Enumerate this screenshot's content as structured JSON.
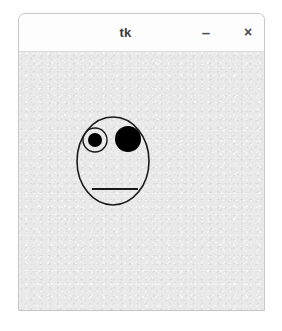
{
  "window": {
    "title": "tk",
    "background_color": "#e9e9e9",
    "titlebar_color": "#fdfdfd",
    "border_color": "#c8c8c8"
  },
  "titlebar": {
    "title_label": "tk",
    "minimize_label": "–",
    "close_label": "×"
  },
  "drawing": {
    "name": "smiley-face",
    "stroke_color": "#1a1a1a",
    "fill_color": "#000000",
    "face": {
      "cx": 94,
      "cy": 147,
      "rx": 36,
      "ry": 44,
      "stroke_width": 1.6
    },
    "left_eye": {
      "cx": 76,
      "cy": 126,
      "r": 12,
      "pupil_r": 7,
      "stroke_width": 1.4
    },
    "right_eye": {
      "cx": 109,
      "cy": 125,
      "r": 13
    },
    "mouth": {
      "x1": 73,
      "y1": 175,
      "x2": 119,
      "y2": 175,
      "stroke_width": 2.2
    }
  }
}
